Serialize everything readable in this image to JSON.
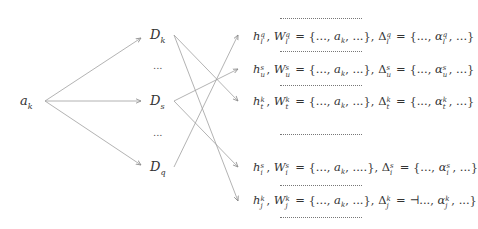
{
  "source": {
    "base": "a",
    "sub": "k"
  },
  "middle_nodes": [
    {
      "base": "D",
      "sub": "k"
    },
    {
      "ellipsis": "..."
    },
    {
      "base": "D",
      "sub": "s"
    },
    {
      "ellipsis": "..."
    },
    {
      "base": "D",
      "sub": "q"
    }
  ],
  "separator": "......................................",
  "rows": [
    {
      "h": "h",
      "sup": "q",
      "sub": "l",
      "W": "W",
      "set_open": " = {..., ",
      "a": "a",
      "a_sub": "k",
      "set_close": ", ...}, ",
      "delta": "Δ",
      "eq": " = {..., ",
      "alpha": "α",
      "close": ", ...}"
    },
    {
      "h": "h",
      "sup": "s",
      "sub": "u",
      "W": "W",
      "set_open": " = {..., ",
      "a": "a",
      "a_sub": "k",
      "set_close": ", ...}, ",
      "delta": "Δ",
      "eq": " = {..., ",
      "alpha": "α",
      "close": ", ...}"
    },
    {
      "h": "h",
      "sup": "k",
      "sub": "t",
      "W": "W",
      "set_open": " = {..., ",
      "a": "a",
      "a_sub": "k",
      "set_close": ", ...}, ",
      "delta": "Δ",
      "eq": " = {..., ",
      "alpha": "α",
      "close": ", ...}"
    },
    {
      "h": "h",
      "sup": "s",
      "sub": "i",
      "W": "W",
      "set_open": " = {..., ",
      "a": "a",
      "a_sub": "k",
      "set_close": ", ....}, ",
      "delta": "Δ",
      "eq": " = {..., ",
      "alpha": "α",
      "close": ", ...}"
    },
    {
      "h": "h",
      "sup": "k",
      "sub": "j",
      "W": "W",
      "set_open": " = {..., ",
      "a": "a",
      "a_sub": "k",
      "set_close": ", ...}, ",
      "delta": "Δ",
      "eq": " = ⊣..., ",
      "alpha": "α",
      "close": ", ...}"
    }
  ],
  "edges": [
    {
      "from": "a_k",
      "to": "D_k"
    },
    {
      "from": "a_k",
      "to": "D_s"
    },
    {
      "from": "a_k",
      "to": "D_q"
    },
    {
      "from": "D_k",
      "to": "row_t_k"
    },
    {
      "from": "D_k",
      "to": "row_j_k"
    },
    {
      "from": "D_s",
      "to": "row_u_s"
    },
    {
      "from": "D_s",
      "to": "row_i_s"
    },
    {
      "from": "D_q",
      "to": "row_l_q"
    }
  ],
  "colors": {
    "edge": "#9a9a9a",
    "text": "#333333"
  }
}
